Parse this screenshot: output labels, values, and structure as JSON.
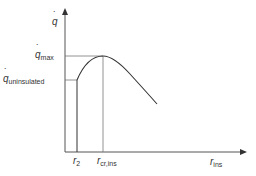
{
  "diagram": {
    "y_axis": {
      "symbol": "q",
      "dot": true
    },
    "x_axis": {
      "symbol": "r",
      "subscript": "ins"
    },
    "labels": {
      "q_max": {
        "symbol": "q",
        "subscript": "max"
      },
      "q_uninsulated": {
        "symbol": "q",
        "subscript": "uninsulated"
      },
      "r2": {
        "symbol": "r",
        "subscript": "2"
      },
      "r_cr": {
        "symbol": "r",
        "subscript": "cr,ins"
      }
    },
    "colors": {
      "line": "#333333",
      "guide": "#777777"
    }
  }
}
